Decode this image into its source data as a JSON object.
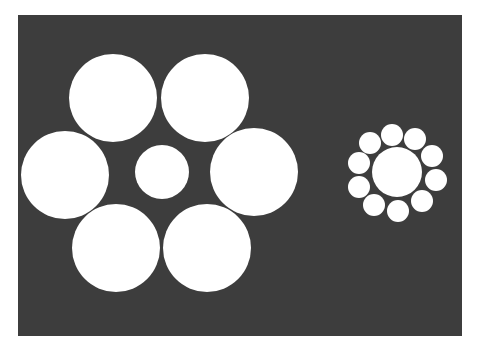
{
  "figure": {
    "background": "#ffffff",
    "panel_color": "#3d3d3d",
    "circle_color": "#ffffff",
    "left_group": {
      "center": {
        "cx": 162,
        "cy": 172,
        "r": 27
      },
      "surround": [
        {
          "cx": 113,
          "cy": 98,
          "r": 44
        },
        {
          "cx": 205,
          "cy": 98,
          "r": 44
        },
        {
          "cx": 65,
          "cy": 175,
          "r": 44
        },
        {
          "cx": 254,
          "cy": 172,
          "r": 44
        },
        {
          "cx": 116,
          "cy": 248,
          "r": 44
        },
        {
          "cx": 207,
          "cy": 248,
          "r": 44
        }
      ]
    },
    "right_group": {
      "center": {
        "cx": 397,
        "cy": 172,
        "r": 25
      },
      "surround": [
        {
          "cx": 392,
          "cy": 135,
          "r": 11
        },
        {
          "cx": 415,
          "cy": 139,
          "r": 11
        },
        {
          "cx": 432,
          "cy": 156,
          "r": 11
        },
        {
          "cx": 436,
          "cy": 180,
          "r": 11
        },
        {
          "cx": 422,
          "cy": 201,
          "r": 11
        },
        {
          "cx": 398,
          "cy": 211,
          "r": 11
        },
        {
          "cx": 374,
          "cy": 205,
          "r": 11
        },
        {
          "cx": 359,
          "cy": 187,
          "r": 11
        },
        {
          "cx": 359,
          "cy": 163,
          "r": 11
        },
        {
          "cx": 370,
          "cy": 143,
          "r": 11
        }
      ]
    }
  }
}
